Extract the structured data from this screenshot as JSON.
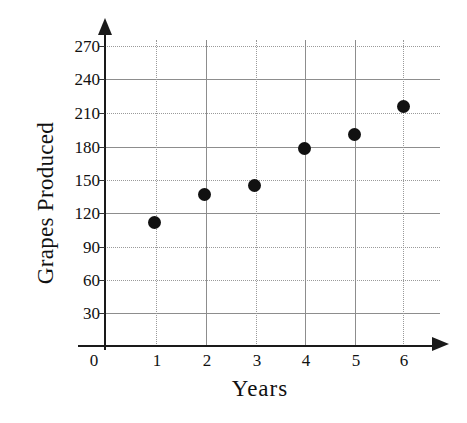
{
  "chart_data": {
    "type": "scatter",
    "title": "",
    "xlabel": "Years",
    "ylabel": "Grapes Produced",
    "x": [
      1,
      2,
      3,
      4,
      5,
      6
    ],
    "values": [
      112,
      138,
      146,
      180,
      192,
      218
    ],
    "points": [
      {
        "x": 1,
        "y": 112
      },
      {
        "x": 2,
        "y": 138
      },
      {
        "x": 3,
        "y": 146
      },
      {
        "x": 4,
        "y": 180
      },
      {
        "x": 5,
        "y": 192
      },
      {
        "x": 6,
        "y": 218
      }
    ],
    "xlim": [
      0,
      6.6
    ],
    "ylim": [
      0,
      285
    ],
    "xticks": [
      "0",
      "1",
      "2",
      "3",
      "4",
      "5",
      "6"
    ],
    "yticks": [
      "30",
      "60",
      "90",
      "120",
      "150",
      "180",
      "210",
      "240",
      "270"
    ],
    "grid": true,
    "legend": false,
    "marker_color": "#111111",
    "grid_color": "#8d8d8d",
    "axis_color": "#1a1a1a"
  },
  "axes": {
    "x_title": "Years",
    "y_title": "Grapes Produced",
    "origin_label": "0"
  }
}
